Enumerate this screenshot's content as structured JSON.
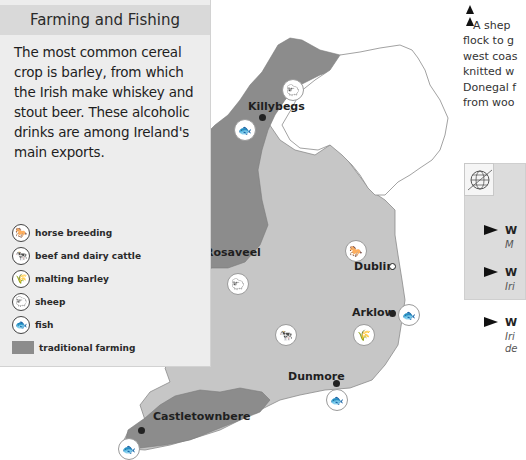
{
  "panel": {
    "title": "Farming and Fishing",
    "body": "The most common cereal crop is barley, from which the Irish make whiskey and stout beer. These alcoholic drinks are among Ireland's main exports.",
    "legend": [
      {
        "icon": "horse-icon",
        "glyph": "🐎",
        "label": "horse breeding"
      },
      {
        "icon": "cow-icon",
        "glyph": "🐄",
        "label": "beef and dairy cattle"
      },
      {
        "icon": "barley-icon",
        "glyph": "🌾",
        "label": "malting barley"
      },
      {
        "icon": "sheep-icon",
        "glyph": "🐑",
        "label": "sheep"
      },
      {
        "icon": "fish-icon",
        "glyph": "🐟",
        "label": "fish"
      },
      {
        "icon": "swatch",
        "glyph": "",
        "label": "traditional farming"
      }
    ]
  },
  "map": {
    "colors": {
      "traditional_farming": "#8c8c8c",
      "other_land": "#c6c6c6",
      "northern_ireland": "#ffffff",
      "outline": "#8a8a8a"
    },
    "towns": [
      {
        "name": "Killybegs",
        "marker": "filled"
      },
      {
        "name": "Rosaveel",
        "marker": "filled"
      },
      {
        "name": "Dublin",
        "marker": "hollow"
      },
      {
        "name": "Arklow",
        "marker": "filled"
      },
      {
        "name": "Dunmore",
        "marker": "filled"
      },
      {
        "name": "Castletownbere",
        "marker": "filled"
      }
    ],
    "icons": {
      "fish": "🐟",
      "sheep": "🐑",
      "horse": "🐎",
      "cow": "🐄",
      "barley": "🌾"
    }
  },
  "side_text": {
    "lines": [
      "A shep",
      "flock to g",
      "west coas",
      "knitted w",
      "Donegal f",
      "from woo"
    ]
  },
  "info_box": {
    "items": [
      {
        "title": "W",
        "sub": "M"
      },
      {
        "title": "W",
        "sub": "Iri"
      },
      {
        "title": "W",
        "sub": "Iri",
        "sub2": "de"
      }
    ]
  }
}
